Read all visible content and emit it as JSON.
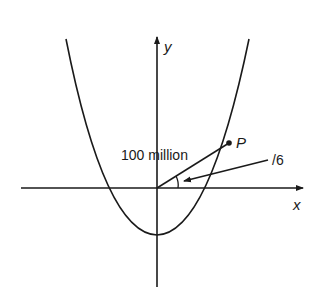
{
  "diagram": {
    "axes": {
      "x_label": "x",
      "y_label": "y"
    },
    "point": {
      "label": "P"
    },
    "annotations": {
      "segment_label": "100 million",
      "angle_label": "/6"
    },
    "colors": {
      "ink": "#1a1a1a",
      "background": "#ffffff"
    }
  }
}
